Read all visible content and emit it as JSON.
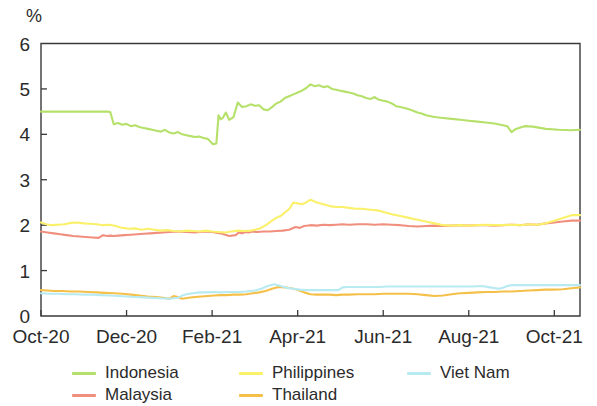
{
  "chart_data": {
    "type": "line",
    "title": "",
    "subtitle": "",
    "xlabel": "",
    "ylabel": "",
    "unit_label": "%",
    "ylim": [
      0,
      6
    ],
    "ytick_labels": [
      "0",
      "1",
      "2",
      "3",
      "4",
      "5",
      "6"
    ],
    "ytick_values": [
      0,
      1,
      2,
      3,
      4,
      5,
      6
    ],
    "xtick_labels": [
      "Oct-20",
      "Dec-20",
      "Feb-21",
      "Apr-21",
      "Jun-21",
      "Aug-21",
      "Oct-21"
    ],
    "xtick_positions": [
      0,
      2,
      4,
      6,
      8,
      10,
      12
    ],
    "xlim": [
      0,
      12.6
    ],
    "grid": false,
    "legend_position": "bottom",
    "x_unit": "months since Oct-2020",
    "series": [
      {
        "name": "Indonesia",
        "color": "#b5e06a",
        "x": [
          0.0,
          0.2,
          0.4,
          0.6,
          0.8,
          1.0,
          1.2,
          1.4,
          1.55,
          1.62,
          1.7,
          1.8,
          1.9,
          2.0,
          2.1,
          2.2,
          2.3,
          2.4,
          2.5,
          2.6,
          2.7,
          2.8,
          2.9,
          3.0,
          3.1,
          3.2,
          3.3,
          3.4,
          3.5,
          3.6,
          3.7,
          3.8,
          3.9,
          3.98,
          4.02,
          4.1,
          4.15,
          4.2,
          4.25,
          4.32,
          4.4,
          4.5,
          4.6,
          4.7,
          4.8,
          4.9,
          5.0,
          5.1,
          5.2,
          5.3,
          5.4,
          5.5,
          5.6,
          5.7,
          5.8,
          5.9,
          6.0,
          6.1,
          6.2,
          6.3,
          6.4,
          6.5,
          6.6,
          6.7,
          6.8,
          6.9,
          7.0,
          7.1,
          7.2,
          7.3,
          7.4,
          7.5,
          7.6,
          7.7,
          7.8,
          7.9,
          8.0,
          8.1,
          8.2,
          8.3,
          8.4,
          8.5,
          8.6,
          8.7,
          8.8,
          8.9,
          9.0,
          9.2,
          9.4,
          9.6,
          9.8,
          10.0,
          10.2,
          10.4,
          10.6,
          10.8,
          10.9,
          11.0,
          11.1,
          11.3,
          11.5,
          11.8,
          12.1,
          12.4,
          12.6
        ],
        "y": [
          4.5,
          4.5,
          4.5,
          4.5,
          4.5,
          4.5,
          4.5,
          4.5,
          4.5,
          4.49,
          4.22,
          4.25,
          4.21,
          4.23,
          4.18,
          4.2,
          4.16,
          4.14,
          4.12,
          4.1,
          4.08,
          4.06,
          4.1,
          4.04,
          4.02,
          4.05,
          4.0,
          3.98,
          3.96,
          3.94,
          3.95,
          3.92,
          3.9,
          3.82,
          3.78,
          3.8,
          4.42,
          4.33,
          4.36,
          4.48,
          4.32,
          4.38,
          4.7,
          4.6,
          4.62,
          4.66,
          4.63,
          4.64,
          4.55,
          4.53,
          4.6,
          4.68,
          4.72,
          4.8,
          4.84,
          4.88,
          4.92,
          4.96,
          5.02,
          5.1,
          5.06,
          5.08,
          5.04,
          5.06,
          5.0,
          4.98,
          4.96,
          4.94,
          4.92,
          4.9,
          4.86,
          4.84,
          4.8,
          4.78,
          4.82,
          4.76,
          4.74,
          4.72,
          4.68,
          4.62,
          4.6,
          4.58,
          4.55,
          4.52,
          4.48,
          4.46,
          4.42,
          4.38,
          4.36,
          4.34,
          4.32,
          4.3,
          4.28,
          4.26,
          4.24,
          4.2,
          4.18,
          4.05,
          4.12,
          4.18,
          4.17,
          4.12,
          4.1,
          4.09,
          4.1
        ],
        "start_value": 4.5,
        "end_value": 4.1,
        "min_value": 3.78,
        "max_value": 5.1
      },
      {
        "name": "Malaysia",
        "color": "#f08f7e",
        "x": [
          0.0,
          0.15,
          0.3,
          0.45,
          0.6,
          0.75,
          0.9,
          1.05,
          1.2,
          1.35,
          1.45,
          1.55,
          1.62,
          1.7,
          1.8,
          1.95,
          2.1,
          2.25,
          2.4,
          2.55,
          2.7,
          2.85,
          3.0,
          3.2,
          3.4,
          3.6,
          3.8,
          4.0,
          4.2,
          4.4,
          4.55,
          4.62,
          4.7,
          4.78,
          4.85,
          4.95,
          5.05,
          5.2,
          5.35,
          5.5,
          5.65,
          5.8,
          5.95,
          6.05,
          6.15,
          6.3,
          6.45,
          6.6,
          6.75,
          6.9,
          7.05,
          7.2,
          7.4,
          7.6,
          7.8,
          8.0,
          8.2,
          8.4,
          8.6,
          8.8,
          9.0,
          9.2,
          9.4,
          9.6,
          9.8,
          10.0,
          10.2,
          10.4,
          10.6,
          10.8,
          11.0,
          11.2,
          11.4,
          11.6,
          11.8,
          12.0,
          12.2,
          12.4,
          12.6
        ],
        "y": [
          1.86,
          1.84,
          1.82,
          1.8,
          1.78,
          1.76,
          1.75,
          1.74,
          1.73,
          1.72,
          1.78,
          1.76,
          1.77,
          1.76,
          1.77,
          1.78,
          1.79,
          1.8,
          1.81,
          1.82,
          1.83,
          1.84,
          1.85,
          1.86,
          1.85,
          1.84,
          1.86,
          1.85,
          1.82,
          1.76,
          1.78,
          1.84,
          1.82,
          1.85,
          1.84,
          1.86,
          1.85,
          1.86,
          1.86,
          1.87,
          1.88,
          1.9,
          1.96,
          1.94,
          1.98,
          2.0,
          1.99,
          2.01,
          2.0,
          2.01,
          2.02,
          2.01,
          2.02,
          2.02,
          2.01,
          2.02,
          2.01,
          2.0,
          1.98,
          1.97,
          1.98,
          1.99,
          1.98,
          1.99,
          2.0,
          1.99,
          2.0,
          2.0,
          1.99,
          2.0,
          2.01,
          2.0,
          2.02,
          2.01,
          2.04,
          2.06,
          2.08,
          2.1,
          2.1
        ],
        "start_value": 1.86,
        "end_value": 2.1,
        "min_value": 1.72,
        "max_value": 2.1
      },
      {
        "name": "Philippines",
        "color": "#faf06a",
        "x": [
          0.0,
          0.12,
          0.25,
          0.4,
          0.55,
          0.7,
          0.85,
          1.0,
          1.15,
          1.3,
          1.45,
          1.6,
          1.75,
          1.9,
          2.05,
          2.2,
          2.35,
          2.5,
          2.65,
          2.8,
          2.95,
          3.1,
          3.25,
          3.4,
          3.55,
          3.7,
          3.85,
          4.0,
          4.15,
          4.3,
          4.45,
          4.6,
          4.75,
          4.9,
          5.0,
          5.1,
          5.2,
          5.3,
          5.4,
          5.5,
          5.6,
          5.7,
          5.8,
          5.9,
          6.0,
          6.1,
          6.2,
          6.3,
          6.45,
          6.6,
          6.75,
          6.9,
          7.05,
          7.2,
          7.35,
          7.5,
          7.7,
          7.9,
          8.05,
          8.2,
          8.4,
          8.6,
          8.8,
          9.0,
          9.2,
          9.4,
          9.6,
          9.8,
          10.0,
          10.2,
          10.4,
          10.6,
          10.8,
          11.0,
          11.2,
          11.4,
          11.6,
          11.8,
          12.0,
          12.2,
          12.4,
          12.6
        ],
        "y": [
          2.06,
          2.02,
          2.0,
          2.01,
          2.02,
          2.05,
          2.06,
          2.04,
          2.03,
          2.02,
          2.0,
          2.01,
          1.98,
          1.94,
          1.92,
          1.93,
          1.9,
          1.92,
          1.9,
          1.88,
          1.89,
          1.87,
          1.86,
          1.88,
          1.87,
          1.86,
          1.88,
          1.86,
          1.85,
          1.84,
          1.86,
          1.88,
          1.87,
          1.88,
          1.9,
          1.92,
          1.97,
          2.03,
          2.1,
          2.16,
          2.2,
          2.28,
          2.35,
          2.5,
          2.48,
          2.46,
          2.5,
          2.56,
          2.5,
          2.46,
          2.42,
          2.4,
          2.4,
          2.38,
          2.36,
          2.36,
          2.34,
          2.32,
          2.28,
          2.24,
          2.2,
          2.16,
          2.12,
          2.08,
          2.04,
          2.0,
          1.99,
          2.0,
          1.99,
          2.0,
          2.01,
          2.0,
          2.0,
          2.01,
          2.0,
          2.02,
          2.01,
          2.04,
          2.1,
          2.16,
          2.22,
          2.22
        ],
        "start_value": 2.06,
        "end_value": 2.22,
        "min_value": 1.84,
        "max_value": 2.56
      },
      {
        "name": "Thailand",
        "color": "#f5c04a",
        "x": [
          0.0,
          0.15,
          0.3,
          0.5,
          0.7,
          0.9,
          1.1,
          1.3,
          1.5,
          1.7,
          1.9,
          2.1,
          2.3,
          2.5,
          2.7,
          2.85,
          3.0,
          3.1,
          3.2,
          3.3,
          3.45,
          3.6,
          3.75,
          3.9,
          4.05,
          4.2,
          4.35,
          4.5,
          4.65,
          4.8,
          4.95,
          5.1,
          5.25,
          5.4,
          5.55,
          5.7,
          5.85,
          6.0,
          6.15,
          6.3,
          6.45,
          6.6,
          6.75,
          6.9,
          7.05,
          7.2,
          7.4,
          7.6,
          7.8,
          8.0,
          8.2,
          8.4,
          8.6,
          8.8,
          9.0,
          9.2,
          9.4,
          9.6,
          9.8,
          10.0,
          10.2,
          10.4,
          10.6,
          10.8,
          11.0,
          11.2,
          11.4,
          11.6,
          11.8,
          12.0,
          12.2,
          12.4,
          12.6
        ],
        "y": [
          0.57,
          0.56,
          0.55,
          0.55,
          0.54,
          0.54,
          0.53,
          0.52,
          0.51,
          0.5,
          0.49,
          0.47,
          0.45,
          0.43,
          0.42,
          0.4,
          0.38,
          0.44,
          0.42,
          0.38,
          0.4,
          0.42,
          0.43,
          0.44,
          0.45,
          0.46,
          0.46,
          0.47,
          0.47,
          0.48,
          0.5,
          0.52,
          0.55,
          0.6,
          0.64,
          0.63,
          0.61,
          0.58,
          0.52,
          0.48,
          0.47,
          0.47,
          0.47,
          0.46,
          0.47,
          0.47,
          0.48,
          0.48,
          0.48,
          0.49,
          0.49,
          0.49,
          0.49,
          0.48,
          0.46,
          0.44,
          0.45,
          0.48,
          0.5,
          0.51,
          0.52,
          0.53,
          0.53,
          0.54,
          0.54,
          0.55,
          0.56,
          0.57,
          0.58,
          0.58,
          0.59,
          0.61,
          0.63
        ],
        "start_value": 0.57,
        "end_value": 0.63,
        "min_value": 0.38,
        "max_value": 0.64
      },
      {
        "name": "Viet Nam",
        "color": "#b8eaf2",
        "x": [
          0.0,
          0.2,
          0.4,
          0.6,
          0.8,
          1.0,
          1.2,
          1.4,
          1.6,
          1.8,
          2.0,
          2.2,
          2.4,
          2.6,
          2.8,
          3.0,
          3.2,
          3.3,
          3.4,
          3.55,
          3.7,
          3.85,
          4.0,
          4.2,
          4.4,
          4.6,
          4.8,
          5.0,
          5.15,
          5.3,
          5.45,
          5.6,
          5.75,
          5.9,
          6.05,
          6.2,
          6.35,
          6.5,
          6.65,
          6.8,
          6.95,
          7.05,
          7.15,
          7.3,
          7.5,
          7.7,
          7.9,
          8.1,
          8.3,
          8.5,
          8.7,
          8.9,
          9.1,
          9.3,
          9.5,
          9.7,
          9.9,
          10.1,
          10.3,
          10.5,
          10.7,
          10.8,
          10.9,
          11.0,
          11.15,
          11.3,
          11.5,
          11.7,
          11.9,
          12.1,
          12.3,
          12.5,
          12.6
        ],
        "y": [
          0.5,
          0.49,
          0.49,
          0.48,
          0.48,
          0.47,
          0.47,
          0.46,
          0.45,
          0.44,
          0.43,
          0.42,
          0.41,
          0.4,
          0.39,
          0.38,
          0.4,
          0.45,
          0.48,
          0.5,
          0.52,
          0.52,
          0.53,
          0.52,
          0.53,
          0.53,
          0.54,
          0.56,
          0.6,
          0.66,
          0.7,
          0.66,
          0.62,
          0.6,
          0.58,
          0.57,
          0.57,
          0.57,
          0.57,
          0.57,
          0.57,
          0.63,
          0.64,
          0.64,
          0.64,
          0.64,
          0.64,
          0.65,
          0.65,
          0.65,
          0.65,
          0.65,
          0.65,
          0.65,
          0.65,
          0.65,
          0.65,
          0.65,
          0.66,
          0.63,
          0.6,
          0.62,
          0.66,
          0.68,
          0.68,
          0.68,
          0.68,
          0.68,
          0.68,
          0.68,
          0.68,
          0.68,
          0.68
        ],
        "start_value": 0.5,
        "end_value": 0.68,
        "min_value": 0.38,
        "max_value": 0.7
      }
    ]
  },
  "legend": {
    "columns": [
      [
        {
          "label": "Indonesia",
          "color": "#b5e06a"
        },
        {
          "label": "Malaysia",
          "color": "#f08f7e"
        }
      ],
      [
        {
          "label": "Philippines",
          "color": "#faf06a"
        },
        {
          "label": "Thailand",
          "color": "#f5c04a"
        }
      ],
      [
        {
          "label": "Viet Nam",
          "color": "#b8eaf2"
        }
      ]
    ]
  }
}
